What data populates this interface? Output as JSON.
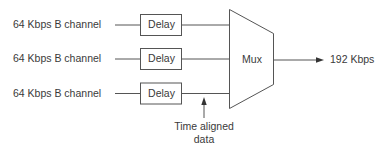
{
  "diagram": {
    "inputs": [
      {
        "label": "64 Kbps B channel",
        "block": "Delay"
      },
      {
        "label": "64 Kbps B channel",
        "block": "Delay"
      },
      {
        "label": "64 Kbps B channel",
        "block": "Delay"
      }
    ],
    "mux": {
      "label": "Mux"
    },
    "output": {
      "label": "192 Kbps"
    },
    "annotation": {
      "line1": "Time aligned",
      "line2": "data"
    },
    "colors": {
      "stroke": "#555555",
      "text": "#3a3a3a",
      "background": "#ffffff"
    }
  }
}
